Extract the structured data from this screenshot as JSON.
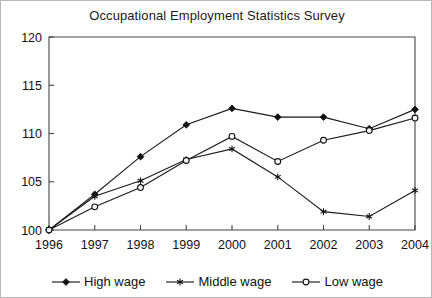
{
  "chart_data": {
    "type": "line",
    "title": "Occupational Employment Statistics Survey",
    "xlabel": "",
    "ylabel": "",
    "categories": [
      "1996",
      "1997",
      "1998",
      "1999",
      "2000",
      "2001",
      "2002",
      "2003",
      "2004"
    ],
    "x": [
      1996,
      1997,
      1998,
      1999,
      2000,
      2001,
      2002,
      2003,
      2004
    ],
    "xlim": [
      1996,
      2004
    ],
    "ylim": [
      100,
      120
    ],
    "yticks": [
      100,
      105,
      110,
      115,
      120
    ],
    "ytick_labels": [
      "100",
      "105",
      "110",
      "115",
      "120"
    ],
    "grid": false,
    "legend_position": "bottom",
    "series": [
      {
        "name": "High wage",
        "marker": "filled-diamond",
        "values": [
          100.0,
          103.7,
          107.6,
          110.9,
          112.6,
          111.7,
          111.7,
          110.5,
          112.5
        ]
      },
      {
        "name": "Middle wage",
        "marker": "asterisk",
        "values": [
          100.0,
          103.5,
          105.1,
          107.3,
          108.4,
          105.5,
          101.9,
          101.4,
          104.1
        ]
      },
      {
        "name": "Low wage",
        "marker": "open-circle",
        "values": [
          100.0,
          102.4,
          104.4,
          107.2,
          109.7,
          107.1,
          109.3,
          110.3,
          111.6
        ]
      }
    ]
  },
  "legend": {
    "items": [
      {
        "label": "High wage",
        "marker": "filled-diamond"
      },
      {
        "label": "Middle wage",
        "marker": "asterisk"
      },
      {
        "label": "Low wage",
        "marker": "open-circle"
      }
    ]
  }
}
